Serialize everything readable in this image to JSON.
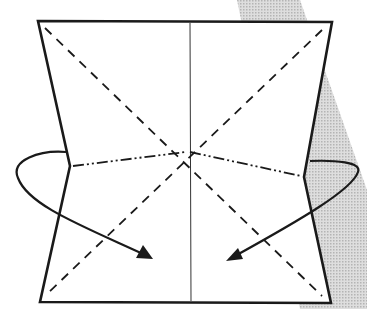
{
  "diagram": {
    "type": "origami-fold-step",
    "colors": {
      "background": "#ffffff",
      "line": "#1a1a1a",
      "shadow_band": "#c8c8c8"
    },
    "paper": {
      "outline": [
        [
          38,
          21
        ],
        [
          332,
          22
        ],
        [
          304,
          177
        ],
        [
          331,
          303
        ],
        [
          40,
          302
        ],
        [
          70,
          166
        ]
      ]
    },
    "creases": {
      "valley_diagonal_1": {
        "from": [
          45,
          28
        ],
        "to": [
          322,
          296
        ],
        "style": "dashed"
      },
      "valley_diagonal_2": {
        "from": [
          322,
          30
        ],
        "to": [
          47,
          294
        ],
        "style": "dashed"
      },
      "mountain_horizontal_left": {
        "from": [
          72,
          166
        ],
        "to": [
          188,
          152
        ],
        "style": "dash-dot-dot"
      },
      "mountain_horizontal_right": {
        "from": [
          188,
          152
        ],
        "to": [
          302,
          176
        ],
        "style": "dash-dot-dot"
      },
      "center_vertical": {
        "from": [
          190,
          22
        ],
        "to": [
          191,
          302
        ],
        "style": "thin-solid"
      }
    },
    "arrows": [
      {
        "name": "left-fold-arrow",
        "direction": "fold inward to the right"
      },
      {
        "name": "right-fold-arrow",
        "direction": "fold inward to the left"
      }
    ]
  }
}
